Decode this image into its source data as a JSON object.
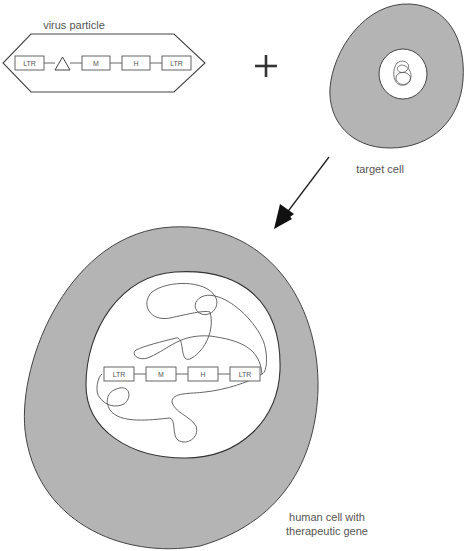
{
  "labels": {
    "virus_particle": "virus particle",
    "target_cell": "target cell",
    "human_cell_line1": "human cell with",
    "human_cell_line2": "therapeutic gene",
    "plus": "+"
  },
  "virus_particle": {
    "segments": [
      "LTR",
      "M",
      "H",
      "LTR"
    ],
    "has_triangle_marker": true
  },
  "human_cell_gene": {
    "segments": [
      "LTR",
      "M",
      "H",
      "LTR"
    ]
  },
  "colors": {
    "cytoplasm": "#b4b4b4",
    "nucleus": "#ffffff",
    "stroke": "#444444",
    "text": "#555555"
  }
}
